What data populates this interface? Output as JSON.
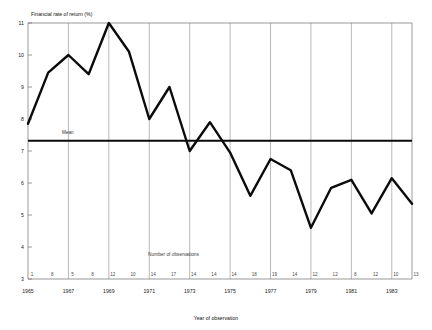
{
  "chart_data": {
    "type": "line",
    "title": "",
    "ylabel": "Financial rate of return (%)",
    "xlabel": "Year of observation",
    "ylim": [
      3,
      11
    ],
    "xlim": [
      1965,
      1984
    ],
    "grid": "vertical-every-2-years",
    "legend": "none",
    "x": [
      1965,
      1966,
      1967,
      1968,
      1969,
      1970,
      1971,
      1972,
      1973,
      1974,
      1975,
      1976,
      1977,
      1978,
      1979,
      1980,
      1981,
      1982,
      1983,
      1984
    ],
    "y_tick_labels": [
      "11",
      "10",
      "9",
      "8",
      "7",
      "6",
      "5",
      "4",
      "3"
    ],
    "y_tick_values": [
      11,
      10,
      9,
      8,
      7,
      6,
      5,
      4,
      3
    ],
    "x_tick_labels": [
      "1965",
      "1967",
      "1969",
      "1971",
      "1973",
      "1975",
      "1977",
      "1979",
      "1981",
      "1983"
    ],
    "x_tick_values": [
      1965,
      1967,
      1969,
      1971,
      1973,
      1975,
      1977,
      1979,
      1981,
      1983
    ],
    "series": [
      {
        "name": "Financial rate of return",
        "values": [
          7.85,
          9.45,
          10.0,
          9.4,
          11.0,
          10.1,
          8.0,
          9.0,
          7.0,
          7.9,
          6.95,
          5.6,
          6.75,
          6.4,
          4.6,
          5.85,
          6.1,
          5.05,
          6.15,
          5.35
        ]
      }
    ],
    "annotations": [
      {
        "name": "mean-line",
        "label": "Mean",
        "value": 7.32,
        "type": "horizontal-line"
      },
      {
        "name": "observations-title",
        "label": "Number of observations"
      }
    ],
    "observations": {
      "title": "Number of observations",
      "counts": [
        1,
        8,
        5,
        8,
        12,
        10,
        14,
        17,
        14,
        14,
        14,
        18,
        19,
        14,
        12,
        12,
        8,
        12,
        10,
        13
      ]
    },
    "colors": {
      "line": "#0b0b0b",
      "mean": "#0b0b0b",
      "grid": "#8a8a8a",
      "axis": "#6e6e6e",
      "background": "#ffffff",
      "text": "#222222"
    }
  }
}
